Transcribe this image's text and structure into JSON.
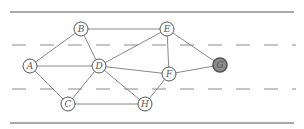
{
  "diagram": {
    "type": "graph",
    "colors": {
      "border_line": "#555555",
      "dashed_line": "#8a8a8a",
      "edge": "#7a7a7a",
      "node_stroke": "#555555",
      "node_fill": "#ffffff",
      "highlight_fill": "#8c8c8c"
    },
    "nodes": [
      {
        "id": "A",
        "label": "A",
        "x": 30,
        "y": 66,
        "highlighted": false
      },
      {
        "id": "B",
        "label": "B",
        "x": 81,
        "y": 29,
        "highlighted": false
      },
      {
        "id": "C",
        "label": "C",
        "x": 68,
        "y": 104,
        "highlighted": false
      },
      {
        "id": "D",
        "label": "D",
        "x": 99,
        "y": 66,
        "highlighted": false
      },
      {
        "id": "E",
        "label": "E",
        "x": 167,
        "y": 29,
        "highlighted": false
      },
      {
        "id": "F",
        "label": "F",
        "x": 169,
        "y": 74,
        "highlighted": false
      },
      {
        "id": "G",
        "label": "G",
        "x": 220,
        "y": 65,
        "highlighted": true
      },
      {
        "id": "H",
        "label": "H",
        "x": 145,
        "y": 104,
        "highlighted": false
      }
    ],
    "edges": [
      [
        "A",
        "B"
      ],
      [
        "A",
        "D"
      ],
      [
        "A",
        "C"
      ],
      [
        "B",
        "D"
      ],
      [
        "B",
        "E"
      ],
      [
        "C",
        "D"
      ],
      [
        "C",
        "H"
      ],
      [
        "D",
        "E"
      ],
      [
        "D",
        "F"
      ],
      [
        "D",
        "H"
      ],
      [
        "E",
        "F"
      ],
      [
        "E",
        "G"
      ],
      [
        "F",
        "G"
      ],
      [
        "F",
        "H"
      ]
    ]
  }
}
